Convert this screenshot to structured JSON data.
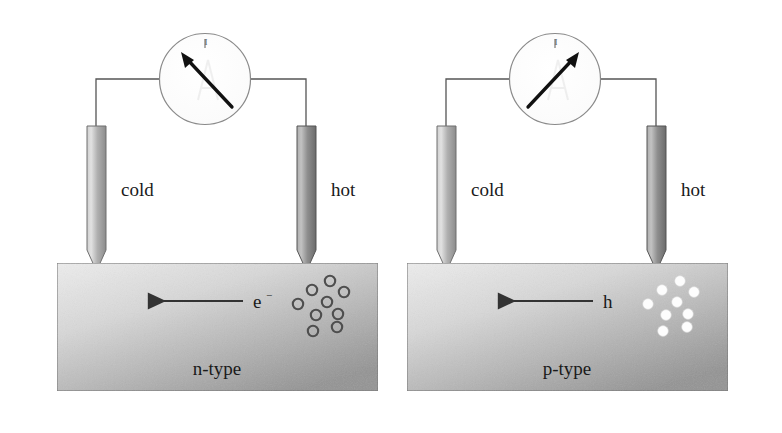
{
  "figure": {
    "background_color": "#ffffff"
  },
  "panels": [
    {
      "id": "n-type-panel",
      "semiconductor_type": "n-type",
      "type_label": "n-type",
      "cold_probe_label": "cold",
      "hot_probe_label": "hot",
      "meter_label": "I",
      "meter_needle_direction": "up-left",
      "carrier_symbol": "e",
      "carrier_superscript": "−",
      "carrier_name": "electron",
      "carrier_marker_style": "open-circle",
      "carrier_marker_count": 9,
      "flow_arrow_direction": "left",
      "block_gradient_from": "#e9e9e9",
      "block_gradient_to": "#9a9a9a",
      "cold_probe_gradient_from": "#d9d9d9",
      "cold_probe_gradient_to": "#8f8f8f",
      "hot_probe_gradient_from": "#b8b8b8",
      "hot_probe_gradient_to": "#6e6e6e"
    },
    {
      "id": "p-type-panel",
      "semiconductor_type": "p-type",
      "type_label": "p-type",
      "cold_probe_label": "cold",
      "hot_probe_label": "hot",
      "meter_label": "I",
      "meter_needle_direction": "up-right",
      "carrier_symbol": "h",
      "carrier_superscript": "",
      "carrier_name": "hole",
      "carrier_marker_style": "filled-white-circle",
      "carrier_marker_count": 9,
      "flow_arrow_direction": "left",
      "block_gradient_from": "#e9e9e9",
      "block_gradient_to": "#9a9a9a",
      "cold_probe_gradient_from": "#d9d9d9",
      "cold_probe_gradient_to": "#8f8f8f",
      "hot_probe_gradient_from": "#b8b8b8",
      "hot_probe_gradient_to": "#6e6e6e"
    }
  ],
  "colors": {
    "stroke": "#4a4a4a",
    "text": "#1a1a1a",
    "wire": "#555555",
    "needle": "#111111",
    "arrow": "#333333",
    "meter_face": "#fdfdfd",
    "meter_rim": "#7a7a7a"
  },
  "geometry": {
    "left_panel_offset_x": 0,
    "right_panel_offset_x": 350,
    "block": {
      "x": 57,
      "y": 263,
      "width": 321,
      "height": 128
    },
    "meter": {
      "cx": 205,
      "cy": 79,
      "r": 46
    },
    "cold_probe": {
      "x": 87,
      "y": 126,
      "width": 19,
      "bar_height": 124,
      "tip_height": 21
    },
    "hot_probe": {
      "x": 297,
      "y": 126,
      "width": 19,
      "bar_height": 124,
      "tip_height": 21
    },
    "flow_arrow": {
      "x_start": 243,
      "x_end": 146,
      "y": 301
    }
  },
  "carrier_markers_n": [
    {
      "cx": 298,
      "cy": 304,
      "r": 5.2
    },
    {
      "cx": 312,
      "cy": 290,
      "r": 5.2
    },
    {
      "cx": 316,
      "cy": 315,
      "r": 5.2
    },
    {
      "cx": 327,
      "cy": 302,
      "r": 5.2
    },
    {
      "cx": 330,
      "cy": 281,
      "r": 5.2
    },
    {
      "cx": 338,
      "cy": 314,
      "r": 5.2
    },
    {
      "cx": 344,
      "cy": 292,
      "r": 5.2
    },
    {
      "cx": 313,
      "cy": 331,
      "r": 5.2
    },
    {
      "cx": 337,
      "cy": 327,
      "r": 5.2
    }
  ],
  "carrier_markers_p": [
    {
      "cx": 298,
      "cy": 304,
      "r": 5.2
    },
    {
      "cx": 312,
      "cy": 290,
      "r": 5.2
    },
    {
      "cx": 316,
      "cy": 315,
      "r": 5.2
    },
    {
      "cx": 327,
      "cy": 302,
      "r": 5.2
    },
    {
      "cx": 330,
      "cy": 281,
      "r": 5.2
    },
    {
      "cx": 338,
      "cy": 314,
      "r": 5.2
    },
    {
      "cx": 344,
      "cy": 292,
      "r": 5.2
    },
    {
      "cx": 313,
      "cy": 331,
      "r": 5.2
    },
    {
      "cx": 337,
      "cy": 327,
      "r": 5.2
    }
  ]
}
